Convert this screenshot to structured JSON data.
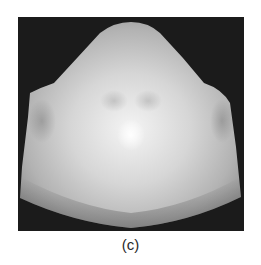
{
  "figure": {
    "caption": "(c)",
    "colors": {
      "background": "#1b1b1b",
      "surface_light": "#eeeeee",
      "surface_mid": "#b9b9b9",
      "surface_dark": "#8e8e8e"
    }
  }
}
